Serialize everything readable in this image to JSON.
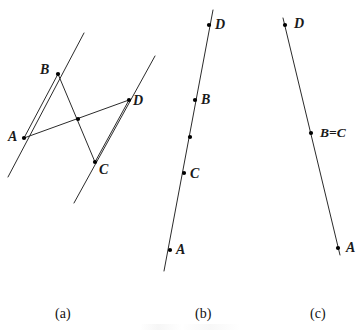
{
  "figure": {
    "background_color": "#ffffff",
    "stroke_color": "#2b2b2b",
    "point_color": "#000000",
    "width": 362,
    "height": 331
  },
  "panels": [
    {
      "id": "a",
      "caption": "(a)",
      "caption_x": 55,
      "caption_y": 307,
      "description": "two parallel lines with crossed segments",
      "lines": [
        {
          "name": "parallel-line-left",
          "x1": 8,
          "y1": 177,
          "x2": 84,
          "y2": 33
        },
        {
          "name": "parallel-line-right",
          "x1": 74,
          "y1": 203,
          "x2": 155,
          "y2": 56
        }
      ],
      "segments": [
        {
          "name": "segment-AB",
          "x1": 24,
          "y1": 138,
          "x2": 58,
          "y2": 74
        },
        {
          "name": "segment-AD",
          "x1": 24,
          "y1": 138,
          "x2": 129,
          "y2": 100
        },
        {
          "name": "segment-BC",
          "x1": 58,
          "y1": 74,
          "x2": 95,
          "y2": 162
        },
        {
          "name": "segment-CD",
          "x1": 95,
          "y1": 162,
          "x2": 129,
          "y2": 100
        }
      ],
      "points": [
        {
          "name": "point-A",
          "label": "A",
          "x": 24,
          "y": 138,
          "label_x": 8,
          "label_y": 130,
          "dot": true
        },
        {
          "name": "point-B",
          "label": "B",
          "x": 58,
          "y": 74,
          "label_x": 40,
          "label_y": 63,
          "dot": true
        },
        {
          "name": "point-C",
          "label": "C",
          "x": 95,
          "y": 162,
          "label_x": 99,
          "label_y": 163,
          "dot": true
        },
        {
          "name": "point-D",
          "label": "D",
          "x": 129,
          "y": 100,
          "label_x": 133,
          "label_y": 94,
          "dot": true
        },
        {
          "name": "point-intersection",
          "label": "",
          "x": 78,
          "y": 119,
          "label_x": 0,
          "label_y": 0,
          "dot": true
        }
      ]
    },
    {
      "id": "b",
      "caption": "(b)",
      "caption_x": 195,
      "caption_y": 307,
      "description": "single line with A, C, B, D collinear",
      "lines": [
        {
          "name": "collinear-line-b",
          "x1": 164,
          "y1": 271,
          "x2": 213,
          "y2": 10
        }
      ],
      "segments": [],
      "points": [
        {
          "name": "point-A",
          "label": "A",
          "x": 170,
          "y": 250,
          "label_x": 176,
          "label_y": 243,
          "dot": true
        },
        {
          "name": "point-C",
          "label": "C",
          "x": 184,
          "y": 173,
          "label_x": 190,
          "label_y": 167,
          "dot": true
        },
        {
          "name": "point-tick",
          "label": "",
          "x": 190,
          "y": 137,
          "label_x": 0,
          "label_y": 0,
          "dot": true
        },
        {
          "name": "point-B",
          "label": "B",
          "x": 195,
          "y": 100,
          "label_x": 201,
          "label_y": 93,
          "dot": true
        },
        {
          "name": "point-D",
          "label": "D",
          "x": 209,
          "y": 25,
          "label_x": 215,
          "label_y": 18,
          "dot": true
        }
      ]
    },
    {
      "id": "c",
      "caption": "(c)",
      "caption_x": 310,
      "caption_y": 307,
      "description": "single line with D, B=C, A collinear",
      "lines": [
        {
          "name": "collinear-line-c",
          "x1": 283,
          "y1": 18,
          "x2": 340,
          "y2": 255
        }
      ],
      "segments": [],
      "points": [
        {
          "name": "point-D",
          "label": "D",
          "x": 285,
          "y": 25,
          "label_x": 294,
          "label_y": 17,
          "dot": true
        },
        {
          "name": "point-B-equals-C",
          "label": "B=C",
          "x": 311,
          "y": 133,
          "label_x": 320,
          "label_y": 126,
          "dot": true
        },
        {
          "name": "point-A",
          "label": "A",
          "x": 338,
          "y": 248,
          "label_x": 346,
          "label_y": 241,
          "dot": true
        }
      ]
    }
  ]
}
